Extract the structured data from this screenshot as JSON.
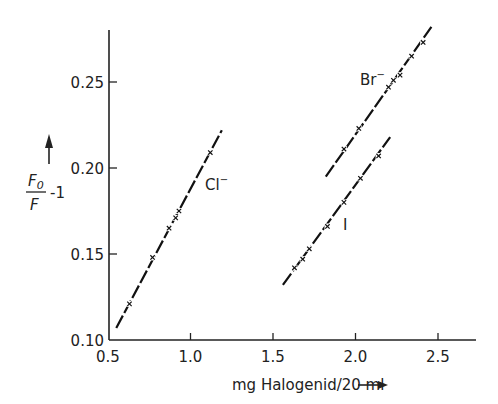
{
  "chart_data": {
    "type": "scatter",
    "title": "",
    "xlabel": "mg Halogenid/20 ml",
    "ylabel": "F0/F - 1",
    "xlim": [
      0.5,
      2.75
    ],
    "ylim": [
      0.1,
      0.28
    ],
    "xticks": [
      "0.5",
      "1.0",
      "1.5",
      "2.0",
      "2.5"
    ],
    "yticks": [
      "0.10",
      "0.15",
      "0.20",
      "0.25"
    ],
    "grid": false,
    "legend": "none (inline labels)",
    "series": [
      {
        "name": "Cl⁻",
        "x": [
          0.63,
          0.77,
          0.87,
          0.91,
          0.93,
          1.12
        ],
        "y": [
          0.121,
          0.148,
          0.165,
          0.171,
          0.175,
          0.209
        ],
        "fit_line": [
          [
            0.55,
            0.107
          ],
          [
            1.19,
            0.222
          ]
        ]
      },
      {
        "name": "Br⁻",
        "x": [
          1.93,
          2.02,
          2.2,
          2.23,
          2.27,
          2.34,
          2.41
        ],
        "y": [
          0.211,
          0.223,
          0.247,
          0.251,
          0.254,
          0.265,
          0.273
        ],
        "fit_line": [
          [
            1.82,
            0.195
          ],
          [
            2.46,
            0.282
          ]
        ]
      },
      {
        "name": "I⁻",
        "x": [
          1.63,
          1.68,
          1.72,
          1.83,
          1.93,
          2.03,
          2.14
        ],
        "y": [
          0.142,
          0.147,
          0.153,
          0.166,
          0.18,
          0.194,
          0.207
        ],
        "fit_line": [
          [
            1.56,
            0.132
          ],
          [
            2.21,
            0.218
          ]
        ]
      }
    ]
  },
  "labels": {
    "cl": "Cl",
    "br": "Br",
    "i": "I",
    "minus": "−",
    "xlabel": "mg Halogenid/20 ml",
    "ylabel_num": "F",
    "ylabel_sub": "0",
    "ylabel_den": "F",
    "ylabel_tail": "-1"
  }
}
